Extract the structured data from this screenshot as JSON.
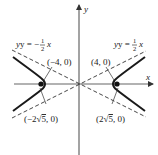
{
  "figure": {
    "type": "hyperbola",
    "equation": "x^2/16 - y^2/4 = 1",
    "axes": {
      "x_label": "x",
      "y_label": "y"
    },
    "asymptotes": [
      {
        "id": "neg",
        "label_lhs": "y = −",
        "frac_num": "1",
        "frac_den": "2",
        "label_var": "x",
        "slope": -0.5
      },
      {
        "id": "pos",
        "label_lhs": "y = ",
        "frac_num": "1",
        "frac_den": "2",
        "label_var": "x",
        "slope": 0.5
      }
    ],
    "points": [
      {
        "id": "left-vertex",
        "label": "(−4, 0)",
        "x": -4,
        "y": 0
      },
      {
        "id": "right-vertex",
        "label": "(4, 0)",
        "x": 4,
        "y": 0
      },
      {
        "id": "left-focus",
        "label_pre": "(−2",
        "label_rad": "5",
        "label_post": ", 0)",
        "x": -4.472,
        "y": 0
      },
      {
        "id": "right-focus",
        "label_pre": "(2",
        "label_rad": "5",
        "label_post": ", 0)",
        "x": 4.472,
        "y": 0
      }
    ],
    "colors": {
      "curve": "#1a1a1a",
      "axis": "#555555",
      "asymptote": "#333333",
      "background": "#ffffff"
    }
  }
}
